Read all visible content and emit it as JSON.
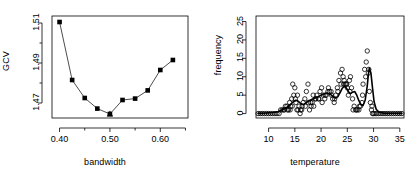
{
  "figure": {
    "background": "#ffffff",
    "foreground": "#000000",
    "width": 420,
    "height": 173
  },
  "chart_data": [
    {
      "type": "line",
      "title": "",
      "xlabel": "bandwidth",
      "ylabel": "GCV",
      "xlim": [
        0.385,
        0.655
      ],
      "ylim": [
        1.4625,
        1.5135
      ],
      "xticks": [
        0.4,
        0.5,
        0.6
      ],
      "xticklabels": [
        "0.40",
        "0.50",
        "0.60"
      ],
      "xminorticks": [
        0.45,
        0.55,
        0.65
      ],
      "yticks": [
        1.47,
        1.49,
        1.51
      ],
      "yticklabels": [
        "1.47",
        "1.49",
        "1.51"
      ],
      "yminorticks": [
        1.48,
        1.5
      ],
      "grid": false,
      "legend": null,
      "series": [
        {
          "name": "GCV curve",
          "marker": "filled-square",
          "line": true,
          "x": [
            0.4,
            0.425,
            0.45,
            0.475,
            0.5,
            0.525,
            0.55,
            0.575,
            0.6,
            0.625
          ],
          "y": [
            1.5105,
            1.4815,
            1.4725,
            1.4672,
            1.4645,
            1.4715,
            1.4722,
            1.4763,
            1.4865,
            1.4915
          ]
        },
        {
          "name": "minimum marker",
          "marker": "filled-triangle",
          "line": false,
          "x": [
            0.5
          ],
          "y": [
            1.4645
          ]
        }
      ]
    },
    {
      "type": "scatter",
      "title": "",
      "xlabel": "temperature",
      "ylabel": "frequency",
      "xlim": [
        7.6,
        35.8
      ],
      "ylim": [
        -1.2,
        26.5
      ],
      "xticks": [
        10,
        15,
        20,
        25,
        30,
        35
      ],
      "xticklabels": [
        "10",
        "15",
        "20",
        "25",
        "30",
        "35"
      ],
      "yticks": [
        0,
        5,
        10,
        15,
        20,
        25
      ],
      "yticklabels": [
        "0",
        "5",
        "10",
        "15",
        "20",
        "25"
      ],
      "grid": false,
      "legend": null,
      "series": [
        {
          "name": "observations",
          "marker": "open-circle",
          "line": false,
          "x": [
            8.0,
            8.4,
            8.8,
            9.2,
            9.6,
            10.0,
            10.4,
            10.8,
            11.2,
            11.6,
            12.0,
            12.3,
            12.6,
            12.9,
            13.2,
            13.5,
            13.8,
            14.0,
            14.2,
            14.4,
            14.6,
            14.8,
            15.0,
            15.2,
            15.4,
            15.6,
            15.8,
            16.0,
            16.3,
            16.6,
            16.9,
            17.2,
            17.5,
            17.8,
            18.0,
            18.3,
            18.6,
            18.9,
            19.2,
            19.5,
            19.8,
            20.1,
            20.4,
            20.7,
            21.0,
            21.3,
            21.6,
            21.9,
            22.2,
            22.5,
            22.8,
            23.1,
            23.4,
            23.7,
            24.0,
            24.2,
            24.4,
            24.6,
            24.8,
            25.0,
            25.2,
            25.4,
            25.6,
            25.8,
            26.0,
            26.3,
            26.6,
            26.9,
            27.2,
            27.5,
            27.8,
            28.0,
            28.3,
            28.6,
            28.8,
            29.0,
            29.2,
            29.4,
            29.6,
            29.8,
            30.0,
            30.3,
            30.6,
            31.0,
            31.4,
            31.8,
            32.2,
            32.6,
            33.0,
            33.4,
            33.8,
            34.2,
            34.6,
            35.0,
            35.4,
            13.0,
            13.6,
            14.1,
            14.5,
            15.1,
            15.5,
            16.1,
            16.4,
            17.0,
            17.6,
            18.1,
            18.5,
            19.0,
            19.6,
            20.2,
            20.8,
            21.4,
            22.0,
            22.6,
            23.2,
            23.8,
            24.3,
            24.9,
            25.5,
            26.1,
            26.7,
            27.3,
            27.9,
            28.5,
            29.1,
            29.7
          ],
          "y": [
            0,
            0,
            0,
            0,
            0,
            0,
            0,
            0,
            0,
            0,
            0,
            1,
            1,
            1,
            2,
            2,
            1,
            3,
            2,
            4,
            8,
            5,
            7,
            3,
            1,
            1,
            2,
            0,
            1,
            3,
            4,
            6,
            8,
            1,
            3,
            3,
            2,
            4,
            5,
            4,
            6,
            7,
            5,
            4,
            5,
            6,
            6,
            6,
            4,
            3,
            5,
            7,
            9,
            11,
            12,
            10,
            9,
            8,
            8,
            7,
            5,
            9,
            10,
            7,
            4,
            2,
            1,
            1,
            1,
            2,
            3,
            8,
            12,
            14,
            17,
            11,
            6,
            3,
            1,
            0,
            0,
            0,
            0,
            0,
            0,
            0,
            0,
            0,
            0,
            0,
            0,
            0,
            0,
            0,
            0,
            1,
            1,
            1,
            2,
            4,
            5,
            1,
            2,
            2,
            3,
            2,
            5,
            4,
            4,
            3,
            5,
            7,
            5,
            4,
            6,
            8,
            8,
            8,
            6,
            1,
            1,
            2,
            5,
            10,
            12,
            2
          ]
        },
        {
          "name": "smooth fit",
          "marker": "none",
          "line": true,
          "x": [
            8.0,
            9.0,
            10.0,
            11.0,
            11.8,
            12.4,
            13.0,
            13.5,
            14.0,
            14.4,
            14.8,
            15.2,
            15.6,
            16.0,
            16.4,
            16.8,
            17.2,
            17.6,
            18.0,
            18.5,
            19.0,
            19.5,
            20.0,
            20.5,
            21.0,
            21.5,
            22.0,
            22.4,
            22.8,
            23.2,
            23.6,
            24.0,
            24.4,
            24.8,
            25.2,
            25.6,
            26.0,
            26.4,
            26.8,
            27.2,
            27.6,
            28.0,
            28.4,
            28.8,
            29.0,
            29.2,
            29.5,
            29.8,
            30.1,
            30.5,
            31.0,
            32.0,
            33.0,
            34.0,
            35.4
          ],
          "y": [
            0.1,
            0.1,
            0.2,
            0.3,
            0.5,
            0.9,
            1.3,
            1.7,
            2.2,
            2.8,
            3.3,
            3.6,
            3.4,
            2.9,
            2.5,
            2.6,
            3.0,
            3.4,
            3.7,
            4.0,
            4.3,
            4.6,
            5.0,
            5.3,
            5.5,
            5.4,
            5.0,
            4.4,
            4.2,
            4.6,
            5.6,
            6.8,
            7.4,
            7.0,
            6.0,
            5.4,
            5.8,
            6.0,
            5.0,
            3.5,
            2.4,
            2.2,
            3.6,
            7.5,
            10.5,
            12.4,
            11.0,
            7.0,
            3.2,
            1.2,
            0.4,
            0.1,
            0.1,
            0.1,
            0.1
          ]
        }
      ]
    }
  ],
  "panels": [
    {
      "id": "gcv-bandwidth-plot",
      "xlabel": "bandwidth",
      "ylabel": "GCV",
      "xticklabels": [
        "0.40",
        "0.50",
        "0.60"
      ],
      "yticklabels": [
        "1.47",
        "1.49",
        "1.51"
      ]
    },
    {
      "id": "frequency-temperature-plot",
      "xlabel": "temperature",
      "ylabel": "frequency",
      "xticklabels": [
        "10",
        "15",
        "20",
        "25",
        "30",
        "35"
      ],
      "yticklabels": [
        "0",
        "5",
        "10",
        "15",
        "20",
        "25"
      ]
    }
  ]
}
